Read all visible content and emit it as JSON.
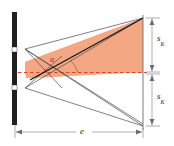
{
  "figure": {
    "colors": {
      "shade_fill": "#f4a783",
      "shade_fill_light": "#f6b394",
      "barrier": "#231f1c",
      "ray_line": "#4a4a4a",
      "bold_ray": "#1a1a1a",
      "dashed_axis": "#d9462b",
      "dimension_line": "#8c8c8c",
      "angle_arc": "#b35a35",
      "background": "#ffffff"
    },
    "labels": {
      "sk_top": {
        "symbol": "s",
        "subscript": "K"
      },
      "sk_bottom": {
        "symbol": "s",
        "subscript": "K"
      },
      "distance": {
        "symbol": "e",
        "subscript": ""
      },
      "angle": {
        "symbol": "α",
        "subscript": ""
      }
    },
    "elements": {
      "barrier_name": "slit-barrier",
      "slit_upper_name": "upper-slit",
      "slit_lower_name": "lower-slit",
      "screen_name": "detector-screen",
      "shaded_region_name": "illuminated-wedge"
    }
  }
}
